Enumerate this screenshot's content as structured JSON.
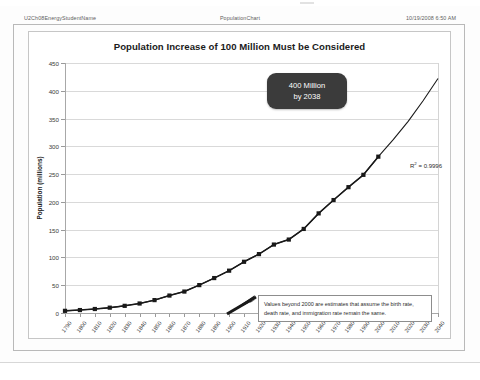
{
  "header": {
    "left": "U2Ch08EnergyStudentName",
    "center": "PopulationChart",
    "right": "10/19/2008 6:50 AM"
  },
  "annotations": {
    "callout_line1": "400 Million",
    "callout_line2": "by 2038",
    "r2_prefix": "R",
    "r2_sup": "2",
    "r2_value": " = 0.9996",
    "note": "Values beyond 2000 are estimates that assume the birth rate, death rate, and immigration rate remain the same."
  },
  "colors": {
    "series": "#1a1a1a",
    "grid": "#d9d9d9",
    "axis": "#a8a8a8",
    "callout_bg": "#3b3b3b",
    "page_border": "#b9b9b9"
  },
  "chart_data": {
    "type": "line",
    "title": "Population Increase of 100 Million Must be Considered",
    "xlabel": "",
    "ylabel": "Population (millions)",
    "xlim": [
      1790,
      2040
    ],
    "ylim": [
      0,
      450
    ],
    "ytick_step": 50,
    "grid": true,
    "legend": "none",
    "yticks": [
      0,
      50,
      100,
      150,
      200,
      250,
      300,
      350,
      400,
      450
    ],
    "categories": [
      "1790",
      "1800",
      "1810",
      "1820",
      "1830",
      "1840",
      "1850",
      "1860",
      "1870",
      "1880",
      "1890",
      "1900",
      "1910",
      "1920",
      "1930",
      "1940",
      "1950",
      "1960",
      "1970",
      "1980",
      "1990",
      "2000",
      "2010",
      "2020",
      "2030",
      "2040"
    ],
    "series": [
      {
        "name": "Population (millions)",
        "marker": "square",
        "values": [
          3.9,
          5.3,
          7.2,
          9.6,
          12.9,
          17.1,
          23.2,
          31.4,
          38.6,
          50.2,
          62.9,
          76.2,
          92.2,
          106.0,
          123.2,
          132.2,
          151.3,
          179.3,
          203.3,
          226.5,
          248.7,
          281.4,
          null,
          null,
          null,
          null
        ]
      },
      {
        "name": "Trendline (exponential fit)",
        "marker": "none",
        "values": [
          3.9,
          5.3,
          7.2,
          9.6,
          12.9,
          17.1,
          23.2,
          31.4,
          38.6,
          50.2,
          62.9,
          76.2,
          92.2,
          106.0,
          123.2,
          132.2,
          151.3,
          179.3,
          203.3,
          226.5,
          248.7,
          281.4,
          312.0,
          345.0,
          382.0,
          422.0
        ]
      }
    ],
    "annotation_points": [
      {
        "label": "400 Million by 2038",
        "x": 2038,
        "y": 400
      }
    ]
  }
}
